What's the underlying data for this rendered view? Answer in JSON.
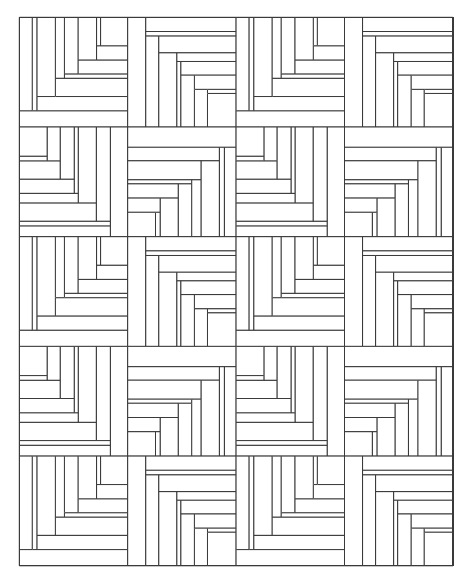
{
  "canvas": {
    "width": 471,
    "height": 583,
    "background": "#ffffff",
    "line_color": "#3a3a3a"
  },
  "grid": {
    "origin_x": 19.3,
    "origin_y": 17.3,
    "cols": 4,
    "rows": 5,
    "cell_width": 108.4,
    "cell_height": 109.7,
    "block_unit": 108,
    "layout": [
      [
        "A",
        "B",
        "A",
        "B"
      ],
      [
        "C",
        "D",
        "C",
        "D"
      ],
      [
        "A",
        "B",
        "A",
        "B"
      ],
      [
        "C",
        "D",
        "C",
        "D"
      ],
      [
        "A",
        "B",
        "A",
        "B"
      ]
    ]
  },
  "blocks": {
    "A": [
      [
        0,
        92,
        108,
        16
      ],
      [
        0,
        0,
        13,
        92
      ],
      [
        13,
        0,
        4.7,
        92
      ],
      [
        17.7,
        78,
        90.3,
        14
      ],
      [
        17.7,
        0,
        18.3,
        78
      ],
      [
        36,
        60,
        72,
        18
      ],
      [
        36,
        0,
        9,
        60
      ],
      [
        45,
        55.7,
        63,
        4.3
      ],
      [
        45,
        0,
        13.7,
        55.7
      ],
      [
        58.7,
        42,
        49.3,
        13.7
      ],
      [
        58.7,
        0,
        18.3,
        42
      ],
      [
        77,
        28,
        31,
        14
      ],
      [
        77,
        0,
        4,
        28
      ],
      [
        81,
        0,
        27,
        28
      ]
    ],
    "B": [
      [
        0,
        0,
        18,
        108
      ],
      [
        18,
        0,
        90,
        14
      ],
      [
        18,
        14,
        90,
        4.5
      ],
      [
        18,
        18.5,
        13,
        89.5
      ],
      [
        31,
        18.5,
        77,
        16.5
      ],
      [
        31,
        35,
        18,
        73
      ],
      [
        49,
        35,
        59,
        8.5
      ],
      [
        49,
        43.5,
        4,
        64.5
      ],
      [
        53,
        43.5,
        55,
        13.5
      ],
      [
        53,
        57,
        13.5,
        51
      ],
      [
        66.5,
        57,
        41.5,
        14
      ],
      [
        66.5,
        71,
        13,
        37
      ],
      [
        79.5,
        71,
        28.5,
        4
      ],
      [
        79.5,
        75,
        28.5,
        33
      ]
    ],
    "C": [
      [
        90.7,
        0,
        17.3,
        108
      ],
      [
        0,
        97.3,
        90.7,
        10.7
      ],
      [
        0,
        92.7,
        90.7,
        4.6
      ],
      [
        76.7,
        0,
        14,
        92.7
      ],
      [
        0,
        74.7,
        76.7,
        18
      ],
      [
        58.7,
        0,
        18,
        74.7
      ],
      [
        0,
        65.3,
        58.7,
        9.4
      ],
      [
        54.7,
        0,
        4,
        65.3
      ],
      [
        0,
        51.3,
        54.7,
        14
      ],
      [
        40.7,
        0,
        14,
        51.3
      ],
      [
        0,
        33.3,
        40.7,
        18
      ],
      [
        27.7,
        0,
        13,
        33.3
      ],
      [
        0,
        28.7,
        27.7,
        4.6
      ],
      [
        0,
        0,
        27.7,
        28.7
      ]
    ],
    "D": [
      [
        0,
        0,
        108,
        20
      ],
      [
        96.3,
        20,
        11.7,
        88
      ],
      [
        91.3,
        20,
        5,
        88
      ],
      [
        0,
        20,
        91.3,
        13.3
      ],
      [
        73,
        33.3,
        18.3,
        74.7
      ],
      [
        0,
        33.3,
        73,
        18.7
      ],
      [
        63.7,
        52,
        9.3,
        56
      ],
      [
        0,
        52,
        63.7,
        4
      ],
      [
        50.3,
        56,
        13.4,
        52
      ],
      [
        0,
        56,
        50.3,
        14
      ],
      [
        32.3,
        70,
        18,
        38
      ],
      [
        0,
        70,
        32.3,
        14
      ],
      [
        27.7,
        84,
        4.6,
        24
      ],
      [
        0,
        84,
        27.7,
        24
      ]
    ]
  }
}
